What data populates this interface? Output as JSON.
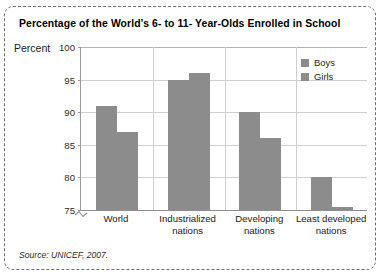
{
  "figure": {
    "title": "Percentage of the World’s 6- to 11- Year-Olds Enrolled in School",
    "y_axis_caption": "Percent",
    "source_note": "Source: UNICEF, 2007."
  },
  "legend": {
    "items": [
      {
        "label": "Boys",
        "color": "#8c8c8c"
      },
      {
        "label": "Girls",
        "color": "#8c8c8c"
      }
    ]
  },
  "ticks": {
    "y": [
      "100",
      "95",
      "90",
      "85",
      "80",
      "75"
    ]
  },
  "categories_display": [
    {
      "line1": "World",
      "line2": ""
    },
    {
      "line1": "Industrialized",
      "line2": "nations"
    },
    {
      "line1": "Developing",
      "line2": "nations"
    },
    {
      "line1": "Least developed",
      "line2": "nations"
    }
  ],
  "chart_data": {
    "type": "bar",
    "title": "Percentage of the World’s 6- to 11- Year-Olds Enrolled in School",
    "xlabel": "",
    "ylabel": "Percent",
    "ylim": [
      75,
      100
    ],
    "yticks": [
      75,
      80,
      85,
      90,
      95,
      100
    ],
    "axis_break": true,
    "grid": true,
    "legend_position": "top-right",
    "categories": [
      "World",
      "Industrialized nations",
      "Developing nations",
      "Least developed nations"
    ],
    "series": [
      {
        "name": "Boys",
        "color": "#8c8c8c",
        "values": [
          91,
          95,
          90,
          80
        ]
      },
      {
        "name": "Girls",
        "color": "#8c8c8c",
        "values": [
          87,
          96,
          86,
          75.5
        ]
      }
    ],
    "source": "UNICEF, 2007."
  }
}
